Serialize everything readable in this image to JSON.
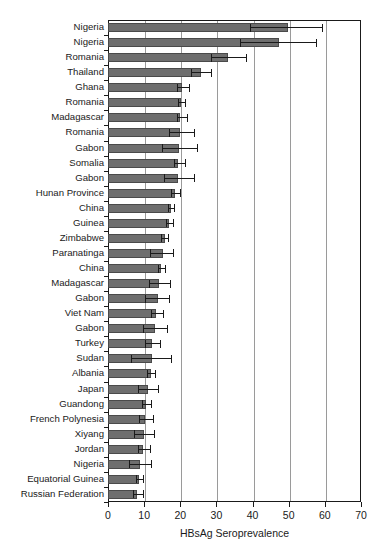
{
  "chart_data": {
    "type": "bar",
    "orientation": "horizontal",
    "title": "",
    "xlabel": "HBsAg Seroprevalence",
    "ylabel": "",
    "xlim": [
      0,
      70
    ],
    "xticks": [
      0,
      10,
      20,
      30,
      40,
      50,
      60,
      70
    ],
    "grid": "vertical",
    "legend": "none",
    "categories": [
      "Nigeria",
      "Nigeria",
      "Romania",
      "Thailand",
      "Ghana",
      "Romania",
      "Madagascar",
      "Romania",
      "Gabon",
      "Somalia",
      "Gabon",
      "Hunan Province",
      "China",
      "Guinea",
      "Zimbabwe",
      "Paranatinga",
      "China",
      "Madagascar",
      "Gabon",
      "Viet Nam",
      "Gabon",
      "Turkey",
      "Sudan",
      "Albania",
      "Japan",
      "Guandong",
      "French Polynesia",
      "Xiyang",
      "Jordan",
      "Nigeria",
      "Equatorial Guinea",
      "Russian Federation"
    ],
    "values": [
      49.7,
      47.2,
      33.3,
      25.6,
      20.6,
      20.1,
      20.0,
      20.0,
      19.6,
      19.4,
      19.3,
      18.6,
      17.4,
      16.9,
      15.7,
      15.1,
      14.8,
      14.2,
      13.9,
      13.3,
      13.1,
      12.2,
      12.1,
      11.8,
      11.0,
      10.4,
      10.2,
      9.9,
      9.7,
      8.8,
      8.5,
      7.9
    ],
    "ci_low": [
      39.4,
      36.4,
      28.4,
      23.1,
      19.0,
      19.3,
      19.0,
      17.0,
      15.0,
      18.3,
      15.6,
      17.4,
      16.5,
      16.0,
      14.8,
      11.5,
      13.8,
      11.4,
      10.3,
      12.0,
      9.7,
      10.1,
      6.5,
      10.7,
      8.4,
      9.5,
      8.5,
      7.1,
      8.2,
      5.7,
      7.7,
      7.0
    ],
    "ci_high": [
      59.2,
      57.5,
      38.3,
      28.6,
      22.3,
      21.4,
      21.8,
      23.8,
      24.5,
      21.2,
      23.8,
      19.9,
      18.3,
      18.1,
      16.7,
      17.9,
      15.8,
      17.1,
      17.0,
      15.2,
      16.4,
      14.4,
      17.4,
      13.1,
      13.7,
      12.0,
      12.4,
      12.8,
      11.5,
      12.0,
      9.8,
      9.6
    ],
    "series_label": "HBsAg seroprevalence with 95% confidence interval",
    "bar_color": "#6e6e6e",
    "bar_edge_color": "#4a4a4a",
    "error_color": "#1a1a1a",
    "grid_color": "#9a9a9a",
    "axis_color": "#1a1a1a",
    "background": "#ffffff"
  }
}
